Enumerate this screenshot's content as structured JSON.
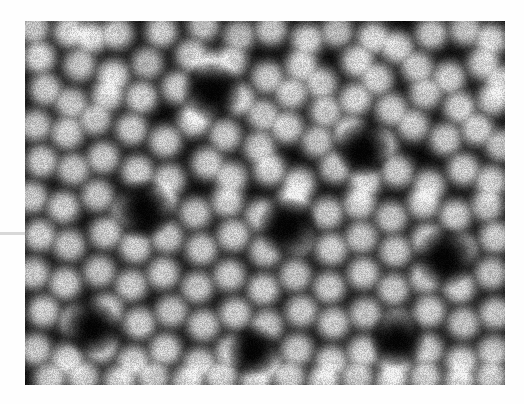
{
  "view": {
    "kind": "scientific-micrograph",
    "modality": "scanning-tunneling-microscopy",
    "page_background": "#ffffff",
    "width": 524,
    "height": 404
  },
  "micrograph": {
    "label": "atomic-resolution-micrograph",
    "x": 25,
    "y": 21,
    "width": 480,
    "height": 364,
    "colormap": "grayscale",
    "background_level": "#030303",
    "peak_level": "#f4f4f4",
    "structure": "dodecagonal quasicrystal surface",
    "motif": "bright protrusions arranged in 12-fold rosettes around dark ring voids",
    "noise_amount": 0.17,
    "blur_radius_px": 3.0,
    "spot_radius_px": 13.5,
    "spot_softness": 0.62,
    "vignette": 0.0
  },
  "artifacts": {
    "margin_scanline": {
      "label": "left-margin-scanline",
      "x": 0,
      "y": 232,
      "width": 26,
      "height": 3,
      "color": "#d8d8d8"
    }
  },
  "chart_data": {
    "type": "heatmap",
    "title": "",
    "xlabel": "",
    "ylabel": "",
    "grid": false,
    "legend": "none",
    "xlim": [
      0,
      480
    ],
    "ylim": [
      0,
      364
    ],
    "colorscale": [
      "#000000",
      "#f6f6f6"
    ],
    "peaks": [
      [
        8,
        6,
        0.86
      ],
      [
        44,
        10,
        0.92
      ],
      [
        66,
        16,
        0.9
      ],
      [
        92,
        12,
        0.88
      ],
      [
        136,
        10,
        0.9
      ],
      [
        178,
        4,
        0.84
      ],
      [
        214,
        14,
        0.8
      ],
      [
        246,
        8,
        0.86
      ],
      [
        282,
        18,
        0.9
      ],
      [
        312,
        10,
        0.82
      ],
      [
        348,
        16,
        0.92
      ],
      [
        372,
        26,
        0.9
      ],
      [
        406,
        12,
        0.88
      ],
      [
        440,
        8,
        0.84
      ],
      [
        466,
        18,
        0.9
      ],
      [
        14,
        36,
        0.94
      ],
      [
        54,
        44,
        0.86
      ],
      [
        88,
        54,
        0.92
      ],
      [
        122,
        42,
        0.8
      ],
      [
        166,
        34,
        0.88
      ],
      [
        186,
        46,
        0.9
      ],
      [
        206,
        40,
        0.86
      ],
      [
        242,
        56,
        0.88
      ],
      [
        276,
        44,
        0.9
      ],
      [
        296,
        62,
        0.86
      ],
      [
        332,
        40,
        0.92
      ],
      [
        352,
        58,
        0.88
      ],
      [
        392,
        46,
        0.86
      ],
      [
        424,
        56,
        0.9
      ],
      [
        458,
        42,
        0.88
      ],
      [
        476,
        60,
        0.84
      ],
      [
        20,
        68,
        0.88
      ],
      [
        46,
        82,
        0.84
      ],
      [
        82,
        74,
        0.86
      ],
      [
        116,
        76,
        0.9
      ],
      [
        152,
        66,
        0.88
      ],
      [
        176,
        86,
        0.86
      ],
      [
        214,
        78,
        0.9
      ],
      [
        238,
        94,
        0.84
      ],
      [
        266,
        72,
        0.88
      ],
      [
        300,
        90,
        0.86
      ],
      [
        330,
        78,
        0.92
      ],
      [
        366,
        88,
        0.88
      ],
      [
        400,
        72,
        0.86
      ],
      [
        434,
        86,
        0.9
      ],
      [
        468,
        78,
        0.88
      ],
      [
        10,
        104,
        0.86
      ],
      [
        42,
        112,
        0.9
      ],
      [
        70,
        98,
        0.84
      ],
      [
        106,
        108,
        0.88
      ],
      [
        140,
        120,
        0.9
      ],
      [
        168,
        100,
        0.86
      ],
      [
        200,
        114,
        0.88
      ],
      [
        234,
        126,
        0.86
      ],
      [
        262,
        106,
        0.9
      ],
      [
        292,
        120,
        0.84
      ],
      [
        324,
        110,
        0.88
      ],
      [
        356,
        124,
        0.9
      ],
      [
        388,
        104,
        0.86
      ],
      [
        420,
        118,
        0.88
      ],
      [
        452,
        108,
        0.9
      ],
      [
        476,
        124,
        0.84
      ],
      [
        16,
        140,
        0.9
      ],
      [
        48,
        148,
        0.86
      ],
      [
        78,
        136,
        0.88
      ],
      [
        112,
        150,
        0.9
      ],
      [
        144,
        158,
        0.84
      ],
      [
        182,
        142,
        0.88
      ],
      [
        206,
        156,
        0.86
      ],
      [
        244,
        148,
        0.9
      ],
      [
        274,
        162,
        0.88
      ],
      [
        310,
        146,
        0.86
      ],
      [
        340,
        160,
        0.9
      ],
      [
        372,
        150,
        0.88
      ],
      [
        404,
        164,
        0.86
      ],
      [
        438,
        148,
        0.9
      ],
      [
        466,
        160,
        0.88
      ],
      [
        6,
        176,
        0.88
      ],
      [
        38,
        186,
        0.9
      ],
      [
        72,
        174,
        0.86
      ],
      [
        102,
        190,
        0.88
      ],
      [
        136,
        178,
        0.9
      ],
      [
        170,
        192,
        0.86
      ],
      [
        202,
        180,
        0.88
      ],
      [
        236,
        194,
        0.9
      ],
      [
        268,
        178,
        0.86
      ],
      [
        302,
        192,
        0.88
      ],
      [
        334,
        182,
        0.9
      ],
      [
        366,
        196,
        0.86
      ],
      [
        398,
        182,
        0.88
      ],
      [
        430,
        194,
        0.9
      ],
      [
        462,
        184,
        0.86
      ],
      [
        14,
        214,
        0.9
      ],
      [
        44,
        224,
        0.86
      ],
      [
        80,
        212,
        0.88
      ],
      [
        110,
        226,
        0.9
      ],
      [
        142,
        216,
        0.86
      ],
      [
        176,
        228,
        0.88
      ],
      [
        208,
        214,
        0.9
      ],
      [
        240,
        230,
        0.86
      ],
      [
        272,
        218,
        0.88
      ],
      [
        306,
        228,
        0.9
      ],
      [
        336,
        216,
        0.86
      ],
      [
        370,
        230,
        0.88
      ],
      [
        402,
        218,
        0.9
      ],
      [
        436,
        228,
        0.86
      ],
      [
        470,
        216,
        0.88
      ],
      [
        8,
        252,
        0.88
      ],
      [
        40,
        262,
        0.9
      ],
      [
        74,
        250,
        0.86
      ],
      [
        106,
        264,
        0.88
      ],
      [
        138,
        252,
        0.9
      ],
      [
        172,
        266,
        0.86
      ],
      [
        204,
        254,
        0.88
      ],
      [
        238,
        268,
        0.9
      ],
      [
        270,
        254,
        0.86
      ],
      [
        304,
        266,
        0.88
      ],
      [
        338,
        252,
        0.9
      ],
      [
        368,
        268,
        0.86
      ],
      [
        400,
        256,
        0.88
      ],
      [
        434,
        266,
        0.9
      ],
      [
        466,
        252,
        0.86
      ],
      [
        18,
        290,
        0.9
      ],
      [
        50,
        300,
        0.86
      ],
      [
        82,
        288,
        0.88
      ],
      [
        114,
        302,
        0.9
      ],
      [
        146,
        290,
        0.86
      ],
      [
        178,
        304,
        0.88
      ],
      [
        210,
        292,
        0.9
      ],
      [
        242,
        304,
        0.86
      ],
      [
        276,
        290,
        0.88
      ],
      [
        308,
        302,
        0.9
      ],
      [
        340,
        292,
        0.86
      ],
      [
        372,
        304,
        0.88
      ],
      [
        404,
        290,
        0.9
      ],
      [
        438,
        302,
        0.86
      ],
      [
        470,
        292,
        0.88
      ],
      [
        10,
        328,
        0.88
      ],
      [
        42,
        338,
        0.9
      ],
      [
        76,
        326,
        0.86
      ],
      [
        108,
        340,
        0.88
      ],
      [
        140,
        328,
        0.9
      ],
      [
        174,
        342,
        0.86
      ],
      [
        206,
        330,
        0.88
      ],
      [
        240,
        342,
        0.9
      ],
      [
        272,
        328,
        0.86
      ],
      [
        306,
        340,
        0.88
      ],
      [
        338,
        330,
        0.9
      ],
      [
        370,
        342,
        0.86
      ],
      [
        402,
        328,
        0.88
      ],
      [
        436,
        340,
        0.9
      ],
      [
        468,
        330,
        0.86
      ],
      [
        24,
        358,
        0.86
      ],
      [
        58,
        356,
        0.88
      ],
      [
        94,
        360,
        0.9
      ],
      [
        128,
        356,
        0.86
      ],
      [
        162,
        360,
        0.88
      ],
      [
        196,
        356,
        0.9
      ],
      [
        230,
        360,
        0.86
      ],
      [
        264,
        356,
        0.88
      ],
      [
        298,
        360,
        0.9
      ],
      [
        332,
        356,
        0.86
      ],
      [
        366,
        360,
        0.88
      ],
      [
        400,
        356,
        0.9
      ],
      [
        434,
        360,
        0.86
      ],
      [
        466,
        356,
        0.88
      ]
    ],
    "voids": [
      [
        186,
        70,
        30
      ],
      [
        118,
        188,
        30
      ],
      [
        262,
        206,
        30
      ],
      [
        338,
        128,
        28
      ],
      [
        420,
        236,
        30
      ],
      [
        66,
        306,
        28
      ],
      [
        372,
        318,
        28
      ],
      [
        228,
        330,
        26
      ]
    ]
  }
}
